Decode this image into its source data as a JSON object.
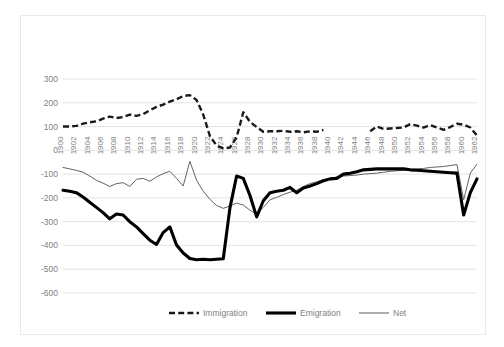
{
  "legend": {
    "position": "bottom",
    "entries": [
      {
        "label": "Immigration",
        "style": "dashed-thick",
        "color": "#1a1a1a"
      },
      {
        "label": "Emigration",
        "style": "solid-thick",
        "color": "#000000"
      },
      {
        "label": "Net",
        "style": "solid-thin",
        "color": "#5a5a5a"
      }
    ]
  },
  "chart_data": {
    "type": "line",
    "title": "",
    "subtitle": "",
    "xlabel": "",
    "ylabel": "",
    "grid": true,
    "xlim": [
      1900,
      1962
    ],
    "ylim": [
      -600,
      300
    ],
    "ytick_step": 100,
    "yticks": [
      300,
      200,
      100,
      0,
      -100,
      -200,
      -300,
      -400,
      -500,
      -600
    ],
    "xtick_step": 2,
    "xticks": [
      1900,
      1902,
      1904,
      1906,
      1908,
      1910,
      1912,
      1914,
      1916,
      1918,
      1920,
      1922,
      1924,
      1926,
      1928,
      1930,
      1932,
      1934,
      1936,
      1938,
      1940,
      1942,
      1944,
      1946,
      1948,
      1950,
      1952,
      1954,
      1956,
      1958,
      1960,
      1962
    ],
    "x": [
      1900,
      1901,
      1902,
      1903,
      1904,
      1905,
      1906,
      1907,
      1908,
      1909,
      1910,
      1911,
      1912,
      1913,
      1914,
      1915,
      1916,
      1917,
      1918,
      1919,
      1920,
      1921,
      1922,
      1923,
      1924,
      1925,
      1926,
      1927,
      1928,
      1929,
      1930,
      1931,
      1932,
      1933,
      1934,
      1935,
      1936,
      1937,
      1938,
      1939,
      1940,
      1941,
      1942,
      1943,
      1944,
      1945,
      1946,
      1947,
      1948,
      1949,
      1950,
      1951,
      1952,
      1953,
      1954,
      1955,
      1956,
      1957,
      1958,
      1959,
      1960,
      1961,
      1962
    ],
    "series": [
      {
        "name": "Immigration",
        "style": "dashed-thick",
        "color": "#1a1a1a",
        "gap_years": [
          1940,
          1941,
          1942,
          1943,
          1944,
          1945
        ],
        "values": [
          100,
          100,
          103,
          112,
          118,
          122,
          133,
          142,
          136,
          140,
          150,
          145,
          152,
          168,
          183,
          192,
          205,
          215,
          228,
          232,
          212,
          150,
          60,
          20,
          8,
          12,
          55,
          160,
          120,
          98,
          78,
          80,
          80,
          82,
          78,
          80,
          76,
          80,
          78,
          86,
          null,
          null,
          null,
          null,
          null,
          null,
          80,
          100,
          90,
          92,
          94,
          96,
          110,
          104,
          96,
          106,
          96,
          86,
          98,
          112,
          108,
          96,
          62
        ]
      },
      {
        "name": "Emigration",
        "style": "solid-thick",
        "color": "#000000",
        "values": [
          -168,
          -172,
          -178,
          -196,
          -218,
          -240,
          -262,
          -288,
          -268,
          -272,
          -300,
          -322,
          -350,
          -378,
          -396,
          -346,
          -322,
          -398,
          -432,
          -455,
          -460,
          -458,
          -460,
          -458,
          -456,
          -242,
          -108,
          -118,
          -190,
          -280,
          -212,
          -178,
          -172,
          -168,
          -156,
          -178,
          -158,
          -150,
          -140,
          -128,
          -120,
          -118,
          -100,
          -96,
          -90,
          -82,
          -80,
          -78,
          -78,
          -78,
          -78,
          -78,
          -82,
          -84,
          -86,
          -88,
          -90,
          -92,
          -94,
          -96,
          -272,
          -178,
          -120
        ]
      },
      {
        "name": "Net",
        "style": "solid-thin",
        "color": "#5a5a5a",
        "values": [
          -72,
          -78,
          -84,
          -92,
          -108,
          -126,
          -138,
          -152,
          -140,
          -136,
          -152,
          -122,
          -118,
          -130,
          -112,
          -98,
          -88,
          -118,
          -150,
          -46,
          -126,
          -172,
          -206,
          -232,
          -244,
          -234,
          -222,
          -230,
          -252,
          -268,
          -240,
          -208,
          -198,
          -186,
          -176,
          -168,
          -152,
          -140,
          -132,
          -124,
          -118,
          -112,
          -108,
          -106,
          -104,
          -100,
          -98,
          -96,
          -92,
          -88,
          -86,
          -84,
          -80,
          -78,
          -76,
          -72,
          -70,
          -68,
          -64,
          -60,
          -208,
          -96,
          -58
        ]
      }
    ],
    "annotations": [
      {
        "text": "World War I immigration collapse",
        "x_range": [
          1914,
          1919
        ]
      },
      {
        "text": "Data gap during World War II",
        "x_range": [
          1939,
          1945
        ]
      }
    ]
  }
}
